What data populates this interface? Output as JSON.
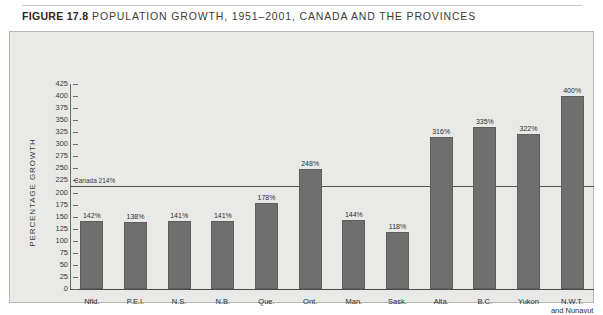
{
  "figure": {
    "number_label": "FIGURE 17.8",
    "title": "POPULATION GROWTH, 1951–2001, CANADA AND THE PROVINCES"
  },
  "chart_data": {
    "type": "bar",
    "title": "POPULATION GROWTH, 1951–2001, CANADA AND THE PROVINCES",
    "xlabel": "",
    "ylabel": "PERCENTAGE GROWTH",
    "ylim": [
      0,
      425
    ],
    "ytick_step": 25,
    "grid": false,
    "legend": "none",
    "yticks": [
      425,
      400,
      375,
      350,
      325,
      300,
      275,
      250,
      225,
      200,
      175,
      150,
      125,
      100,
      75,
      50,
      25,
      0
    ],
    "categories": [
      "Nfld.",
      "P.E.I.",
      "N.S.",
      "N.B.",
      "Que.",
      "Ont.",
      "Man.",
      "Sask.",
      "Alta.",
      "B.C.",
      "Yukon",
      "N.W.T. and Nunavut"
    ],
    "category_labels_multiline": [
      [
        "Nfld."
      ],
      [
        "P.E.I."
      ],
      [
        "N.S."
      ],
      [
        "N.B."
      ],
      [
        "Que."
      ],
      [
        "Ont."
      ],
      [
        "Man."
      ],
      [
        "Sask."
      ],
      [
        "Alta."
      ],
      [
        "B.C."
      ],
      [
        "Yukon"
      ],
      [
        "N.W.T.",
        "and Nunavut"
      ]
    ],
    "values": [
      142,
      138,
      141,
      141,
      178,
      248,
      144,
      118,
      316,
      335,
      322,
      400
    ],
    "value_labels": [
      "142%",
      "138%",
      "141%",
      "141%",
      "178%",
      "248%",
      "144%",
      "118%",
      "316%",
      "335%",
      "322%",
      "400%"
    ],
    "reference_line": {
      "value": 214,
      "label": "Canada 214%"
    },
    "colors": {
      "bar": "#6f6f6f",
      "panel_background": "#e9e9e7",
      "axis": "#4a4a4a",
      "reference_line": "#555555",
      "text": "#2e2e2e"
    }
  }
}
